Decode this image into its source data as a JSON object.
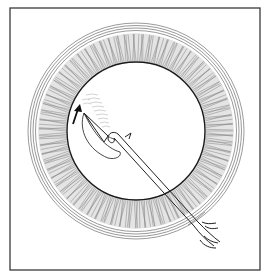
{
  "figure": {
    "colors": {
      "background": "#ffffff",
      "frame": "#3a3a3a",
      "line": "#222222",
      "iris_fill": "#d8d8d8",
      "iris_stroke": "#8a8a8a"
    },
    "frame": {
      "x": 10,
      "y": 8,
      "w": 250,
      "h": 262
    },
    "eye": {
      "cx": 136,
      "cy": 131,
      "limbus_r": 107,
      "iris_outer_r": 98,
      "pupil_r": 69
    },
    "instrument": {
      "tip": [
        84,
        113
      ],
      "handle_end": [
        218,
        243
      ]
    },
    "arrow": {
      "from": [
        73,
        124
      ],
      "to": [
        79,
        106
      ]
    }
  }
}
